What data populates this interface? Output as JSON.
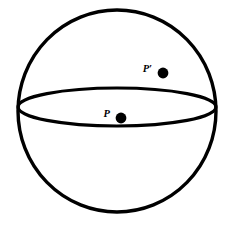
{
  "figure": {
    "name": "sphere-with-equator-and-two-points",
    "background_color": "#ffffff",
    "stroke_color": "#000000",
    "fill_color": "none",
    "canvas": {
      "width": 234,
      "height": 227
    }
  },
  "sphere": {
    "outline_name": "sphere-outline-circle",
    "center_x": 117,
    "center_y": 111,
    "radius_x": 99,
    "radius_y": 101,
    "stroke_width": 3.4
  },
  "equator": {
    "outline_name": "equator-ellipse",
    "center_x": 117,
    "center_y": 107,
    "radius_x": 99,
    "radius_y": 19,
    "stroke_width": 3.2
  },
  "points": [
    {
      "id": "point-p-prime",
      "label": "P′",
      "label_x": 152,
      "label_y": 72,
      "dot_x": 163,
      "dot_y": 73,
      "dot_radius": 5.4,
      "label_font_size": 10.5
    },
    {
      "id": "point-p",
      "label": "P",
      "label_x": 110,
      "label_y": 117,
      "dot_x": 121,
      "dot_y": 118,
      "dot_radius": 5.4,
      "label_font_size": 10.5
    }
  ]
}
